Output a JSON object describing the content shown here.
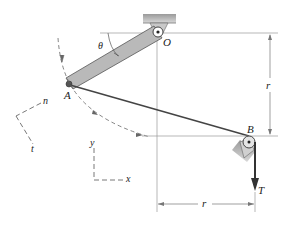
{
  "figure": {
    "type": "mechanics diagram",
    "labels": {
      "point_O": "O",
      "point_A": "A",
      "point_B": "B",
      "angle": "θ",
      "tension": "T",
      "radius_vertical": "r",
      "radius_horizontal": "r",
      "axis_n": "n",
      "axis_t": "t",
      "axis_x": "x",
      "axis_y": "y"
    },
    "colors": {
      "rod_fill": "#b9b9b9",
      "rod_stroke": "#555555",
      "cable": "#444444",
      "support_fill": "#c8c8c8",
      "dimension": "#777777",
      "dashed": "#666666"
    }
  }
}
